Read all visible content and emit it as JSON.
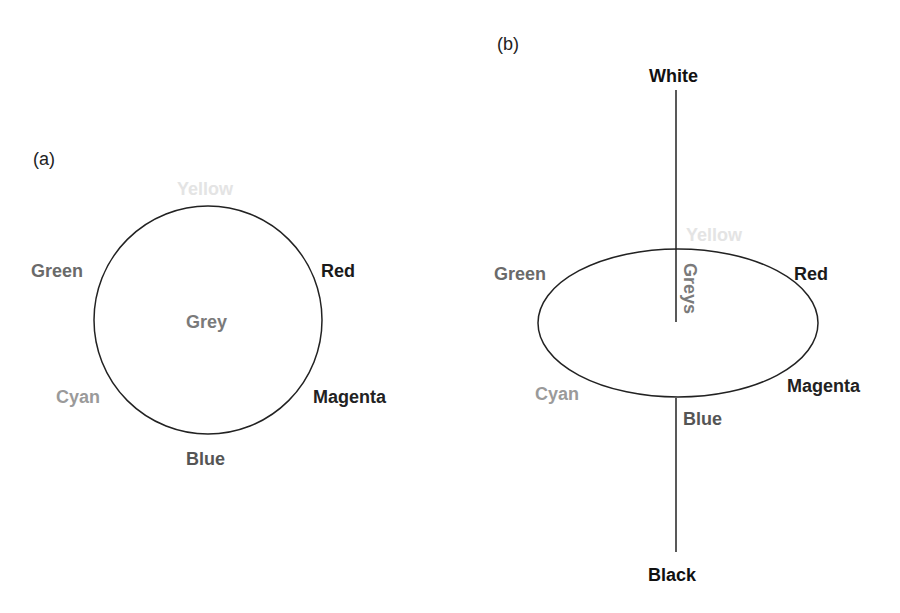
{
  "panels": {
    "a": {
      "label": "(a)",
      "center": "Grey",
      "hues": {
        "yellow": "Yellow",
        "red": "Red",
        "magenta": "Magenta",
        "blue": "Blue",
        "cyan": "Cyan",
        "green": "Green"
      }
    },
    "b": {
      "label": "(b)",
      "top": "White",
      "bottom": "Black",
      "axis": "Greys",
      "hues": {
        "yellow": "Yellow",
        "red": "Red",
        "magenta": "Magenta",
        "blue": "Blue",
        "cyan": "Cyan",
        "green": "Green"
      }
    }
  },
  "colors": {
    "yellow": "#e4e4e4",
    "green": "#6a6a6a",
    "cyan": "#9a9a9a",
    "blue": "#555555",
    "red": "#1a1a1a",
    "magenta": "#222222",
    "grey": "#7a7a7a",
    "white_label": "#111111",
    "black_label": "#111111"
  }
}
